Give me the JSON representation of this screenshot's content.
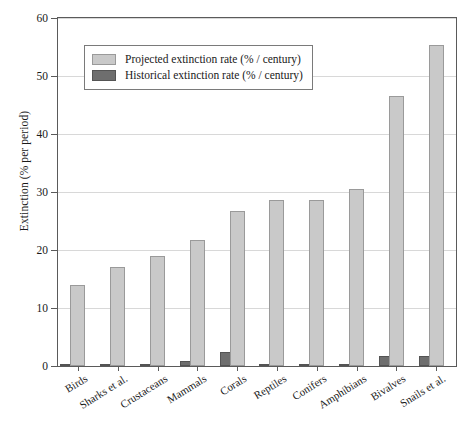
{
  "chart_data": {
    "type": "bar",
    "title": "",
    "xlabel": "",
    "ylabel": "Extinction (% per period)",
    "ylim": [
      0,
      60
    ],
    "yticks": [
      0,
      10,
      20,
      30,
      40,
      50,
      60
    ],
    "ytick_labels": [
      "0",
      "10",
      "20",
      "30",
      "40",
      "50",
      "60"
    ],
    "grid": true,
    "grid_axis": "y",
    "legend_position": "upper left",
    "categories": [
      "Birds",
      "Sharks et al.",
      "Crustaceans",
      "Mammals",
      "Corals",
      "Reptiles",
      "Conifers",
      "Amphibians",
      "Bivalves",
      "Snails et al."
    ],
    "series": [
      {
        "name": "Projected extinction rate (% / century)",
        "color": "#c9c9c9",
        "values": [
          13.9,
          17.0,
          18.9,
          21.8,
          26.7,
          28.7,
          28.7,
          30.6,
          46.5,
          55.3
        ]
      },
      {
        "name": "Historical extinction rate (% / century)",
        "color": "#6e6e6e",
        "values": [
          0.4,
          0.05,
          0.05,
          0.8,
          2.5,
          0.4,
          0.05,
          0.3,
          1.7,
          1.7
        ]
      }
    ]
  },
  "colors": {
    "projected": "#c9c9c9",
    "historical": "#6e6e6e",
    "axis": "#5a5a5a",
    "grid": "#d8d8d8",
    "background": "#ffffff"
  }
}
